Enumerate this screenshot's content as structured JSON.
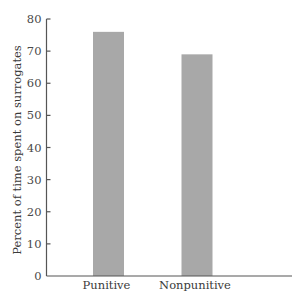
{
  "chart_data": {
    "type": "bar",
    "title": "",
    "xlabel": "",
    "ylabel": "Percent of time spent on surrogates",
    "categories": [
      "Punitive",
      "Nonpunitive"
    ],
    "values": [
      76,
      69
    ],
    "ylim": [
      0,
      80
    ],
    "yticks": [
      0,
      10,
      20,
      30,
      40,
      50,
      60,
      70,
      80
    ],
    "grid": false,
    "legend": null,
    "bar_color": "#a8a8a8"
  },
  "layout": {
    "axis_x": 46.5,
    "y_zero": 276,
    "y_top": 19,
    "x_axis_end": 292,
    "tick_len": 4,
    "bar_width": 31,
    "bar_centers": [
      108.5,
      197
    ]
  },
  "colors": {
    "bar": "#a8a8a8",
    "axis": "#555555",
    "text": "#3a3a3a"
  }
}
